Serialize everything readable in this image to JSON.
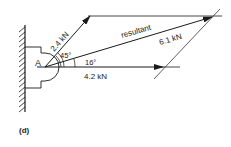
{
  "figure": {
    "caption": "(d)",
    "point_label": "A",
    "forces": [
      {
        "name": "force-1",
        "label": "2.4 kN",
        "magnitude_kN": 2.4,
        "angle_deg": 45
      },
      {
        "name": "force-2",
        "label": "4.2 kN",
        "magnitude_kN": 4.2,
        "angle_deg": 0
      },
      {
        "name": "resultant",
        "label": "6.1 kN",
        "magnitude_kN": 6.1,
        "angle_deg": 16
      }
    ],
    "resultant_label": "resultant",
    "angle_labels": {
      "a1": "45°",
      "a2": "16°"
    },
    "colors": {
      "line": "#1a1a1a",
      "background": "#ffffff"
    }
  }
}
